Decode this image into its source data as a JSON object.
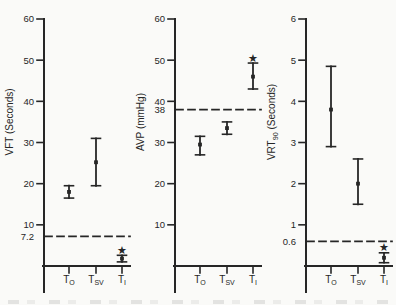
{
  "figure": {
    "ink_color": "#262626",
    "paper_color": "#fafaf8",
    "star_glyph": "★"
  },
  "chart_data": [
    {
      "type": "scatter",
      "ylabel_parts": [
        {
          "text": "VFT (Seconds)",
          "sub": false
        }
      ],
      "ylabel": "VFT (Seconds)",
      "xlabel": "",
      "ylim": [
        0,
        60
      ],
      "yticks": [
        60,
        50,
        40,
        30,
        20,
        10
      ],
      "grid": false,
      "reference_line": {
        "value": 7.2,
        "label": "7.2",
        "style": "dashed"
      },
      "categories": [
        {
          "base": "T",
          "sub": "O"
        },
        {
          "base": "T",
          "sub": "SV"
        },
        {
          "base": "T",
          "sub": "I"
        }
      ],
      "series": [
        {
          "category_index": 0,
          "mean": 18,
          "lo": 16.5,
          "hi": 19.5,
          "significant": false
        },
        {
          "category_index": 1,
          "mean": 25.2,
          "lo": 19.5,
          "hi": 31,
          "significant": false
        },
        {
          "category_index": 2,
          "mean": 1.8,
          "lo": 1.0,
          "hi": 2.6,
          "significant": true,
          "star_value": 3.9
        }
      ]
    },
    {
      "type": "scatter",
      "ylabel_parts": [
        {
          "text": "AVP (mmHg)",
          "sub": false
        }
      ],
      "ylabel": "AVP (mmHg)",
      "xlabel": "",
      "ylim": [
        0,
        60
      ],
      "yticks": [
        60,
        50,
        40,
        30,
        20,
        10
      ],
      "grid": false,
      "reference_line": {
        "value": 38,
        "label": "38",
        "style": "dashed"
      },
      "categories": [
        {
          "base": "T",
          "sub": "O"
        },
        {
          "base": "T",
          "sub": "SV"
        },
        {
          "base": "T",
          "sub": "I"
        }
      ],
      "series": [
        {
          "category_index": 0,
          "mean": 29.5,
          "lo": 27,
          "hi": 31.5,
          "significant": false
        },
        {
          "category_index": 1,
          "mean": 33.5,
          "lo": 32,
          "hi": 35,
          "significant": false
        },
        {
          "category_index": 2,
          "mean": 46,
          "lo": 43,
          "hi": 49.3,
          "significant": true,
          "star_value": 50.5
        }
      ]
    },
    {
      "type": "scatter",
      "ylabel_parts": [
        {
          "text": "VRT",
          "sub": false
        },
        {
          "text": "90",
          "sub": true
        },
        {
          "text": " (Seconds)",
          "sub": false
        }
      ],
      "ylabel": "VRT90 (Seconds)",
      "xlabel": "",
      "ylim": [
        0,
        6
      ],
      "yticks": [
        6,
        5,
        4,
        3,
        2,
        1
      ],
      "grid": false,
      "reference_line": {
        "value": 0.6,
        "label": "0.6",
        "style": "dashed"
      },
      "categories": [
        {
          "base": "T",
          "sub": "O"
        },
        {
          "base": "T",
          "sub": "SV"
        },
        {
          "base": "T",
          "sub": "I"
        }
      ],
      "series": [
        {
          "category_index": 0,
          "mean": 3.8,
          "lo": 2.9,
          "hi": 4.85,
          "significant": false
        },
        {
          "category_index": 1,
          "mean": 2.0,
          "lo": 1.5,
          "hi": 2.6,
          "significant": false
        },
        {
          "category_index": 2,
          "mean": 0.2,
          "lo": 0.08,
          "hi": 0.32,
          "significant": true,
          "star_value": 0.45
        }
      ]
    }
  ]
}
